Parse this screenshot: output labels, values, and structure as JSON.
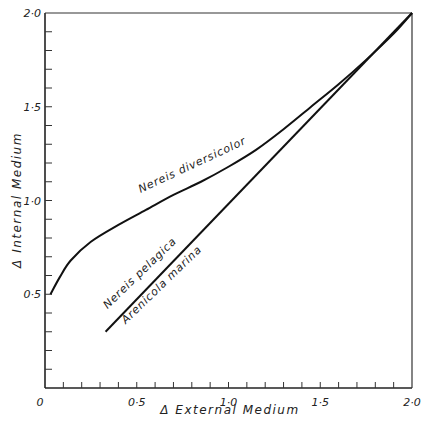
{
  "chart_data": {
    "type": "line",
    "title": "",
    "xlabel": "Δ  External  Medium",
    "ylabel": "Δ  Internal  Medium",
    "xlim": [
      0,
      2.0
    ],
    "ylim": [
      0,
      2.0
    ],
    "grid": false,
    "x_major_ticks": [
      0,
      0.5,
      1.0,
      1.5,
      2.0
    ],
    "x_tick_labels": [
      "0",
      "0·5",
      "1·0",
      "1·5",
      "2·0"
    ],
    "x_minor_step": 0.1,
    "y_major_ticks": [
      0.5,
      1.0,
      1.5,
      2.0
    ],
    "y_tick_labels": [
      "0·5",
      "1·0",
      "1·5",
      "2·0"
    ],
    "y_minor_step": 0.1,
    "series": [
      {
        "name": "Nereis diversicolor",
        "x": [
          0.03,
          0.08,
          0.14,
          0.25,
          0.4,
          0.55,
          0.7,
          0.85,
          1.0,
          1.15,
          1.3,
          1.45,
          1.6,
          1.75,
          1.9,
          2.0
        ],
        "y": [
          0.5,
          0.59,
          0.68,
          0.78,
          0.87,
          0.95,
          1.03,
          1.1,
          1.18,
          1.27,
          1.38,
          1.5,
          1.62,
          1.75,
          1.89,
          2.0
        ]
      },
      {
        "name": "Nereis pelagica / Arenicola marina",
        "x": [
          0.33,
          2.0
        ],
        "y": [
          0.3,
          2.0
        ]
      }
    ],
    "annotations": [
      {
        "text": "Nereis diversicolor",
        "x": 0.8,
        "y": 1.12
      },
      {
        "text": "Nereis pelagica",
        "x": 0.5,
        "y": 0.58
      },
      {
        "text": "Arenicola marina",
        "x": 0.56,
        "y": 0.52
      }
    ]
  }
}
